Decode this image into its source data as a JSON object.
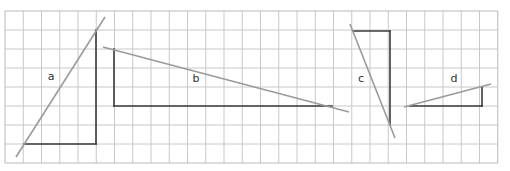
{
  "grid": {
    "x0": 5,
    "y0": 11,
    "cols": 27,
    "rows": 8,
    "cell_w": 18.25,
    "cell_h": 19,
    "line_color": "#c8c8c8",
    "border_color": "#b8b8b8"
  },
  "colors": {
    "triangle_edge": "#3a3a3a",
    "slope_line": "#9a9a9a",
    "label": "#333333"
  },
  "figures": [
    {
      "id": "a",
      "label": "a",
      "label_pos": [
        51,
        80
      ],
      "legs": [
        [
          24,
          144,
          96,
          144
        ],
        [
          96,
          144,
          96,
          30
        ]
      ],
      "slope_line": [
        16,
        157,
        105,
        17
      ]
    },
    {
      "id": "b",
      "label": "b",
      "label_pos": [
        196,
        82
      ],
      "legs": [
        [
          114,
          49,
          114,
          106
        ],
        [
          114,
          106,
          332,
          106
        ]
      ],
      "slope_line": [
        103,
        47,
        349,
        112
      ]
    },
    {
      "id": "c",
      "label": "c",
      "label_pos": [
        361,
        82
      ],
      "legs": [
        [
          353,
          31,
          390,
          31
        ],
        [
          390,
          31,
          390,
          125
        ]
      ],
      "slope_line": [
        350,
        24,
        395,
        138
      ]
    },
    {
      "id": "d",
      "label": "d",
      "label_pos": [
        454,
        82
      ],
      "legs": [
        [
          410,
          106,
          482,
          106
        ],
        [
          482,
          106,
          482,
          87
        ]
      ],
      "slope_line": [
        404,
        107,
        491,
        84
      ]
    }
  ]
}
